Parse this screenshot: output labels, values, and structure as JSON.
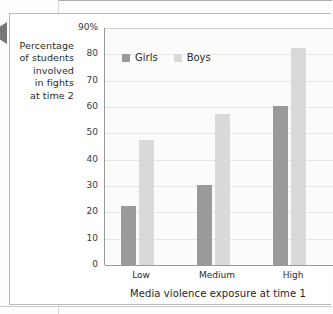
{
  "chart_data": {
    "type": "bar",
    "title": "",
    "xlabel": "Media violence exposure at time 1",
    "ylabel": "Percentage of students involved in fights at time 2",
    "categories": [
      "Low",
      "Medium",
      "High"
    ],
    "series": [
      {
        "name": "Girls",
        "color": "#9a9a9a",
        "values": [
          22.5,
          30.5,
          60.5
        ]
      },
      {
        "name": "Boys",
        "color": "#d9d9d9",
        "values": [
          47.5,
          57.5,
          82.5
        ]
      }
    ],
    "ylim": [
      0,
      90
    ],
    "ytick_labels": [
      "90%",
      "80",
      "70",
      "60",
      "50",
      "40",
      "30",
      "20",
      "10",
      "0"
    ],
    "ytick_values": [
      90,
      80,
      70,
      60,
      50,
      40,
      30,
      20,
      10,
      0
    ],
    "grid": true,
    "legend_position": "upper-left-inside"
  },
  "y_caption_lines": [
    "Percentage",
    "of students",
    "involved",
    "in fights",
    "at time 2"
  ],
  "legend": {
    "items": [
      {
        "label": "Girls",
        "swatch": "girls-swatch"
      },
      {
        "label": "Boys",
        "swatch": "boys-swatch"
      }
    ]
  },
  "colors": {
    "girls_bar": "#9a9a9a",
    "boys_bar": "#d9d9d9",
    "gridline": "#e6e6e4",
    "axis": "#9a9a98",
    "plot_background": "#fbfbfa",
    "text": "#2b2b2b"
  }
}
